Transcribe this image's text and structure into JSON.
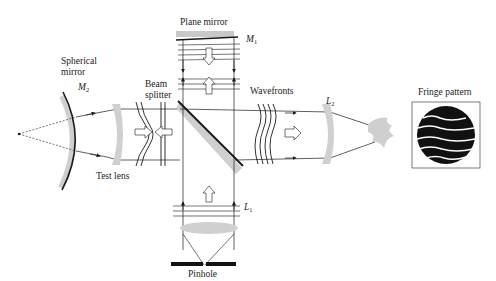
{
  "diagram": {
    "labels": {
      "plane_mirror": "Plane mirror",
      "m1_main": "M",
      "m1_sub": "1",
      "spherical_mirror_line1": "Spherical",
      "spherical_mirror_line2": "mirror",
      "m2_main": "M",
      "m2_sub": "2",
      "beam_splitter_line1": "Beam",
      "beam_splitter_line2": "splitter",
      "wavefronts": "Wavefronts",
      "l2_main": "L",
      "l2_sub": "2",
      "fringe_pattern": "Fringe pattern",
      "test_lens": "Test lens",
      "l1_main": "L",
      "l1_sub": "1",
      "pinhole": "Pinhole"
    },
    "colors": {
      "line": "#1a1a1a",
      "optic_gray": "#c8c8c8",
      "fringe_fill": "#111111"
    }
  }
}
